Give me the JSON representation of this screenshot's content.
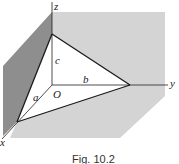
{
  "figure": {
    "caption": "Fig. 10.2",
    "labels": {
      "z_axis": "z",
      "y_axis": "y",
      "x_axis": "x",
      "origin": "O",
      "edge_a": "a",
      "edge_b": "b",
      "edge_c": "c"
    },
    "colors": {
      "back_plane": "#d4d4d4",
      "left_plane": "#8e8e8e",
      "floor_plane": "#d4d4d4",
      "triangle_fill": "#ffffff",
      "lines": "#1a1a1a"
    }
  }
}
